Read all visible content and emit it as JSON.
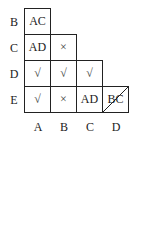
{
  "row_labels": [
    "B",
    "C",
    "D",
    "E"
  ],
  "col_labels": [
    "A",
    "B",
    "C",
    "D"
  ],
  "cells": {
    "B_A": "AC",
    "C_A": "AD",
    "C_B": "×",
    "D_A": "√",
    "D_B": "√",
    "D_C": "√",
    "E_A": "√",
    "E_B": "×",
    "E_C": "AD",
    "E_D": "BC"
  }
}
